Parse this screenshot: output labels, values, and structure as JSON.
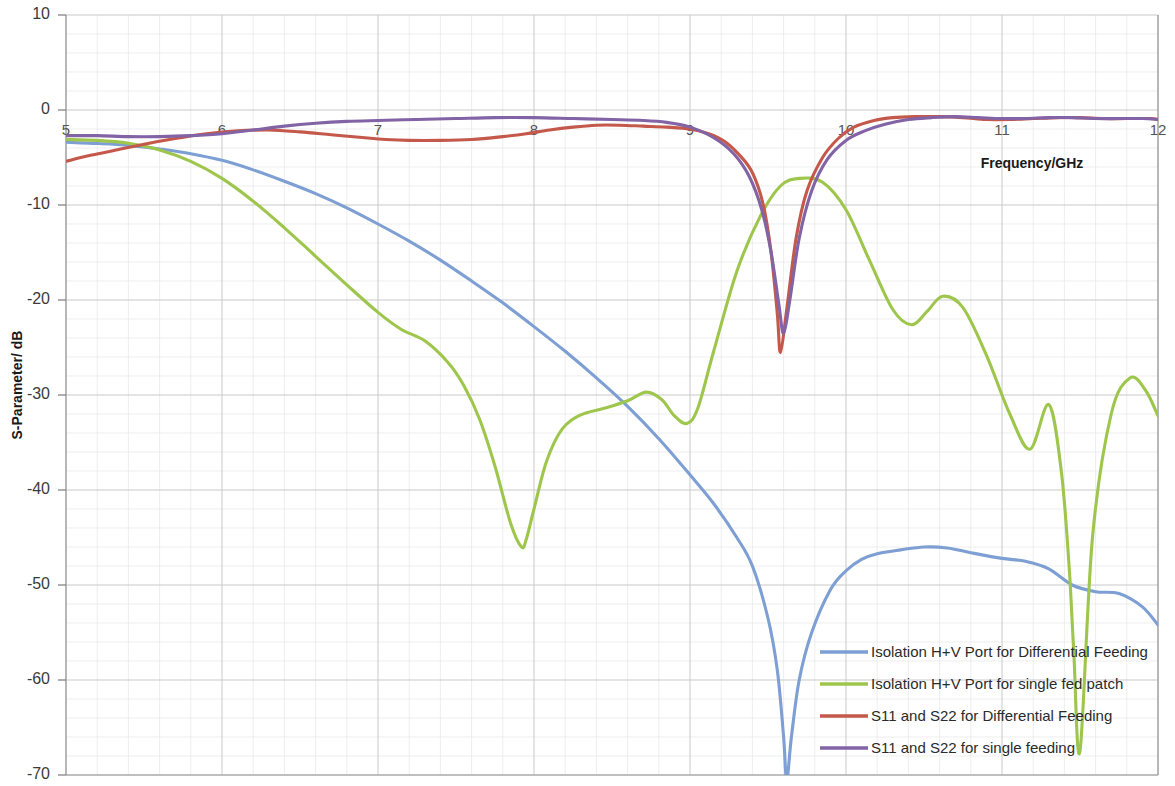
{
  "chart_data": {
    "type": "line",
    "title": "",
    "xlabel": "Frequency/GHz",
    "ylabel": "S-Parameter/ dB",
    "xlim": [
      5,
      12
    ],
    "ylim": [
      -70,
      10
    ],
    "xticks": [
      5,
      6,
      7,
      8,
      9,
      10,
      11,
      12
    ],
    "yticks": [
      10,
      0,
      -10,
      -20,
      -30,
      -40,
      -50,
      -60,
      -70
    ],
    "xtick_labels": [
      "5",
      "6",
      "7",
      "8",
      "9",
      "10",
      "11",
      "12"
    ],
    "ytick_labels": [
      "10",
      "0",
      "-10",
      "-20",
      "-30",
      "-40",
      "-50",
      "-60",
      "-70"
    ],
    "grid": true,
    "grid_minor_per_major_x": 5,
    "grid_minor_per_major_y": 5,
    "legend_position": "bottom-right",
    "colors": {
      "isolation_differential": "#7d9fd3",
      "isolation_single": "#9ec64c",
      "s11_differential": "#c4584a",
      "s11_single": "#8264a6",
      "grid_major": "#c9c9c9",
      "grid_minor": "#e6e6e6",
      "axis": "#9a9a9a",
      "text": "#2b2b2b"
    },
    "series": [
      {
        "name": "Isolation H+V Port for Differential Feeding",
        "color": "#7d9fd3",
        "x": [
          5.0,
          5.15,
          5.3,
          5.45,
          5.6,
          5.8,
          6.0,
          6.2,
          6.4,
          6.6,
          6.8,
          7.0,
          7.2,
          7.4,
          7.6,
          7.8,
          8.0,
          8.2,
          8.4,
          8.6,
          8.8,
          9.0,
          9.15,
          9.3,
          9.4,
          9.5,
          9.56,
          9.6,
          9.62,
          9.65,
          9.7,
          9.78,
          9.9,
          10.0,
          10.1,
          10.2,
          10.35,
          10.5,
          10.65,
          10.8,
          11.0,
          11.15,
          11.3,
          11.45,
          11.6,
          11.75,
          11.9,
          12.0
        ],
        "y": [
          -3.4,
          -3.5,
          -3.6,
          -3.8,
          -4.1,
          -4.6,
          -5.3,
          -6.3,
          -7.5,
          -8.8,
          -10.3,
          -12.0,
          -13.8,
          -15.8,
          -18.0,
          -20.3,
          -22.8,
          -25.4,
          -28.2,
          -31.2,
          -34.6,
          -38.4,
          -41.4,
          -45.0,
          -48.0,
          -53.5,
          -59.0,
          -66.0,
          -70.5,
          -66.0,
          -60.0,
          -55.0,
          -50.5,
          -48.5,
          -47.3,
          -46.7,
          -46.3,
          -46.0,
          -46.1,
          -46.6,
          -47.2,
          -47.5,
          -48.3,
          -50.0,
          -50.7,
          -50.9,
          -52.3,
          -54.2
        ]
      },
      {
        "name": "Isolation H+V Port for single fed patch",
        "color": "#9ec64c",
        "x": [
          5.0,
          5.2,
          5.4,
          5.6,
          5.8,
          6.0,
          6.2,
          6.4,
          6.6,
          6.8,
          7.0,
          7.15,
          7.3,
          7.45,
          7.55,
          7.65,
          7.75,
          7.85,
          7.92,
          7.95,
          8.0,
          8.08,
          8.18,
          8.3,
          8.45,
          8.6,
          8.72,
          8.82,
          8.9,
          8.98,
          9.05,
          9.15,
          9.3,
          9.45,
          9.58,
          9.7,
          9.85,
          10.0,
          10.15,
          10.3,
          10.42,
          10.52,
          10.62,
          10.75,
          10.9,
          11.05,
          11.18,
          11.3,
          11.38,
          11.43,
          11.46,
          11.5,
          11.58,
          11.7,
          11.82,
          11.92,
          12.0
        ],
        "y": [
          -3.1,
          -3.2,
          -3.5,
          -4.2,
          -5.4,
          -7.2,
          -9.6,
          -12.4,
          -15.4,
          -18.4,
          -21.3,
          -23.1,
          -24.3,
          -26.6,
          -29.0,
          -32.5,
          -37.5,
          -43.5,
          -46.0,
          -45.2,
          -42.0,
          -37.0,
          -33.6,
          -32.1,
          -31.4,
          -30.6,
          -29.7,
          -30.5,
          -32.2,
          -33.0,
          -31.4,
          -25.5,
          -17.0,
          -11.2,
          -8.0,
          -7.2,
          -7.6,
          -10.5,
          -15.8,
          -21.0,
          -22.6,
          -21.2,
          -19.6,
          -20.8,
          -25.8,
          -32.0,
          -35.7,
          -31.0,
          -38.0,
          -48.0,
          -57.0,
          -67.5,
          -45.0,
          -32.0,
          -28.2,
          -29.5,
          -32.2
        ]
      },
      {
        "name": "S11 and S22 for Differential Feeding",
        "color": "#c4584a",
        "x": [
          5.0,
          5.15,
          5.3,
          5.5,
          5.7,
          5.9,
          6.1,
          6.3,
          6.5,
          6.7,
          6.9,
          7.05,
          7.2,
          7.4,
          7.6,
          7.8,
          7.95,
          8.1,
          8.25,
          8.4,
          8.55,
          8.7,
          8.85,
          9.0,
          9.12,
          9.22,
          9.32,
          9.4,
          9.47,
          9.52,
          9.56,
          9.58,
          9.62,
          9.68,
          9.75,
          9.85,
          9.95,
          10.05,
          10.18,
          10.3,
          10.45,
          10.6,
          10.75,
          10.9,
          11.05,
          11.2,
          11.35,
          11.5,
          11.65,
          11.8,
          11.95,
          12.0
        ],
        "y": [
          -5.4,
          -4.8,
          -4.3,
          -3.6,
          -3.0,
          -2.5,
          -2.2,
          -2.1,
          -2.3,
          -2.6,
          -2.9,
          -3.1,
          -3.2,
          -3.2,
          -3.1,
          -2.8,
          -2.5,
          -2.1,
          -1.8,
          -1.6,
          -1.6,
          -1.7,
          -1.8,
          -2.0,
          -2.5,
          -3.3,
          -4.8,
          -6.6,
          -10.0,
          -15.0,
          -21.5,
          -25.5,
          -21.0,
          -13.5,
          -8.5,
          -5.0,
          -3.0,
          -1.8,
          -1.1,
          -0.8,
          -0.7,
          -0.7,
          -0.8,
          -1.0,
          -1.0,
          -0.9,
          -0.8,
          -0.8,
          -0.9,
          -0.9,
          -0.9,
          -1.0
        ]
      },
      {
        "name": "S11 and S22 for single feeding",
        "color": "#8264a6",
        "x": [
          5.0,
          5.2,
          5.4,
          5.6,
          5.8,
          6.0,
          6.2,
          6.4,
          6.6,
          6.8,
          7.0,
          7.25,
          7.5,
          7.75,
          8.0,
          8.25,
          8.5,
          8.7,
          8.85,
          9.0,
          9.15,
          9.28,
          9.38,
          9.46,
          9.52,
          9.57,
          9.6,
          9.64,
          9.7,
          9.78,
          9.88,
          10.0,
          10.12,
          10.25,
          10.4,
          10.55,
          10.7,
          10.85,
          11.0,
          11.15,
          11.3,
          11.45,
          11.6,
          11.75,
          11.9,
          12.0
        ],
        "y": [
          -2.7,
          -2.7,
          -2.8,
          -2.8,
          -2.7,
          -2.5,
          -2.1,
          -1.7,
          -1.4,
          -1.2,
          -1.1,
          -1.0,
          -0.9,
          -0.8,
          -0.8,
          -0.9,
          -1.0,
          -1.1,
          -1.3,
          -1.8,
          -2.9,
          -4.6,
          -7.0,
          -10.5,
          -15.0,
          -20.5,
          -23.5,
          -20.0,
          -13.5,
          -8.5,
          -5.2,
          -3.2,
          -2.2,
          -1.5,
          -1.0,
          -0.8,
          -0.7,
          -0.8,
          -0.9,
          -0.9,
          -0.8,
          -0.8,
          -0.9,
          -0.9,
          -0.9,
          -1.0
        ]
      }
    ]
  },
  "legend": {
    "entries": [
      {
        "label": "Isolation H+V Port for Differential Feeding",
        "color": "#7d9fd3"
      },
      {
        "label": "Isolation H+V Port for single fed patch",
        "color": "#9ec64c"
      },
      {
        "label": "S11 and S22 for Differential Feeding",
        "color": "#c4584a"
      },
      {
        "label": "S11 and S22 for single feeding",
        "color": "#8264a6"
      }
    ]
  },
  "axes": {
    "x_title": "Frequency/GHz",
    "y_title": "S-Parameter/ dB"
  }
}
